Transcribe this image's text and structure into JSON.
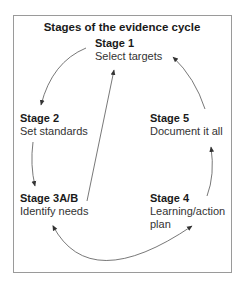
{
  "title": "Stages of the evidence cycle",
  "stages": [
    {
      "name": "Stage 1",
      "desc": "Select targets"
    },
    {
      "name": "Stage 2",
      "desc": "Set standards"
    },
    {
      "name": "Stage 3A/B",
      "desc": "Identify needs"
    },
    {
      "name": "Stage 4",
      "desc": "Learning/action",
      "desc2": "plan"
    },
    {
      "name": "Stage 5",
      "desc": "Document it all"
    }
  ],
  "flow": [
    {
      "from": "Stage 1",
      "to": "Stage 2"
    },
    {
      "from": "Stage 2",
      "to": "Stage 3A/B"
    },
    {
      "from": "Stage 3A/B",
      "to": "Stage 1"
    },
    {
      "from": "Stage 4",
      "to": "Stage 3A/B",
      "bidirectional": true
    },
    {
      "from": "Stage 4",
      "to": "Stage 5"
    },
    {
      "from": "Stage 5",
      "to": "Stage 1"
    }
  ],
  "colors": {
    "border": "#9a9a9a",
    "arrow": "#555555",
    "text": "#1a1a1a"
  }
}
